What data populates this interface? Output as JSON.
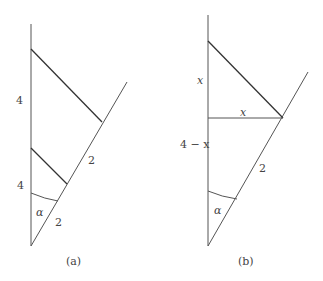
{
  "figure": {
    "panels": [
      {
        "id": "a",
        "caption": "(a)",
        "labels": {
          "upper_vertical": "4",
          "lower_vertical": "4",
          "slant_upper": "2",
          "slant_lower": "2",
          "angle": "α"
        }
      },
      {
        "id": "b",
        "caption": "(b)",
        "labels": {
          "upper_vertical": "x",
          "horizontal": "x",
          "lower_vertical": "4 − x",
          "slant": "2",
          "angle": "α"
        }
      }
    ]
  }
}
